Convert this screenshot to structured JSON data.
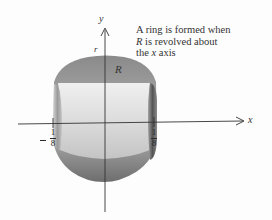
{
  "figure": {
    "caption_lines": [
      "A ring is formed when",
      " is revolved about",
      "the ",
      " axis"
    ],
    "caption_region": "R",
    "caption_axis": "x",
    "axes": {
      "x_label": "x",
      "y_label": "y"
    },
    "labels": {
      "radius": "r",
      "region": "R"
    },
    "ticks": {
      "left": {
        "sign": "-",
        "numerator": "1",
        "denominator": "8"
      },
      "right": {
        "numerator": "1",
        "denominator": "8"
      }
    },
    "colors": {
      "shell_dark": "#7a7a7a",
      "shell_mid": "#a8a8a8",
      "hole_light": "#e6e6e6",
      "axis": "#333333",
      "background": "#fdfdfd"
    }
  }
}
